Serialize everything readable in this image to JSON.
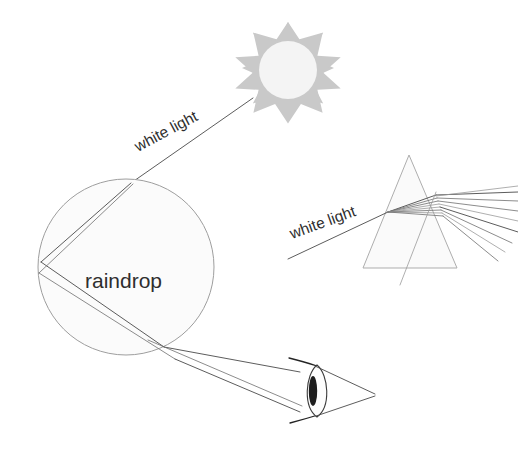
{
  "diagram": {
    "labels": {
      "raindrop": "raindrop",
      "white_light_raindrop": "white light",
      "white_light_prism": "white light"
    },
    "colors": {
      "background": "#ffffff",
      "ray_stroke": "#4a4a4a",
      "ray_faint": "#9a9a9a",
      "shape_fill": "#fbfbfb",
      "shape_stroke": "#9e9e9e",
      "sun_burst": "#c9c9c9",
      "sun_core": "#f4f4f4",
      "eye_pupil": "#1d1d1d",
      "text": "#2e2e2e"
    },
    "objects": {
      "sun": {
        "name": "sun",
        "center_x": 288,
        "center_y": 68,
        "outer_radius": 46,
        "inner_radius": 30,
        "core_radius": 28,
        "points": 9
      },
      "raindrop": {
        "name": "raindrop",
        "center_x": 126,
        "center_y": 267,
        "radius": 88,
        "label_x": 85,
        "label_y": 288
      },
      "prism": {
        "name": "prism",
        "apex_x": 409,
        "apex_y": 155,
        "base_left_x": 363,
        "base_right_x": 457,
        "base_y": 268,
        "dispersed_ray_count": 8
      },
      "eye": {
        "name": "eye",
        "center_x": 317,
        "center_y": 391,
        "lens_half_width": 13,
        "lens_half_height": 27,
        "pupil_x": 313,
        "pupil_y": 391,
        "cone_apex_x": 375,
        "cone_apex_y": 394
      }
    },
    "ray_labels": {
      "white_light_raindrop": {
        "x": 138,
        "y": 152,
        "rotation": -28
      },
      "white_light_prism": {
        "x": 292,
        "y": 239,
        "rotation": -20
      }
    }
  }
}
